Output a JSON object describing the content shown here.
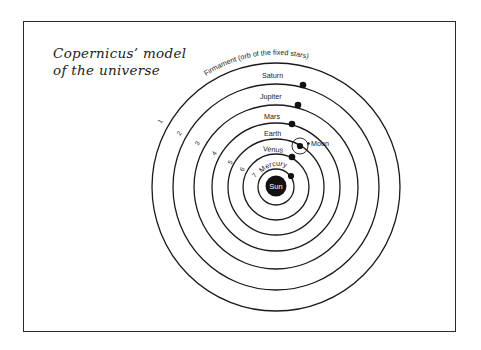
{
  "title": {
    "line1": "Copernicus’ model",
    "line2": "of the universe"
  },
  "diagram": {
    "center": [
      276,
      187
    ],
    "firmament_label": "Firmament (orb of the fixed stars)",
    "orbits": [
      {
        "number": "1",
        "radius": 124,
        "body": "Firmament"
      },
      {
        "number": "2",
        "radius": 103,
        "body": "Saturn"
      },
      {
        "number": "3",
        "radius": 82,
        "body": "Jupiter"
      },
      {
        "number": "4",
        "radius": 64,
        "body": "Mars"
      },
      {
        "number": "5",
        "radius": 48,
        "body": "Earth"
      },
      {
        "number": "6",
        "radius": 33,
        "body": "Venus"
      },
      {
        "number": "7",
        "radius": 18,
        "body": "Mercury"
      }
    ],
    "planets": [
      {
        "name": "Saturn",
        "label": "Saturn"
      },
      {
        "name": "Jupiter",
        "label": "Jupiter"
      },
      {
        "name": "Mars",
        "label": "Mars"
      },
      {
        "name": "Earth",
        "label": "Earth"
      },
      {
        "name": "Venus",
        "label": "Venus"
      },
      {
        "name": "Mercury",
        "label": "Mercury"
      }
    ],
    "moon_label": "Moon",
    "sun_label": "Sun",
    "colors": {
      "ink": "#1a1a1a",
      "paper": "#ffffff"
    }
  }
}
